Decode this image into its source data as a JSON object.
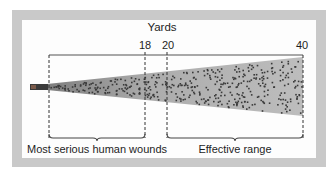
{
  "diagram": {
    "axis_title": "Yards",
    "ticks": [
      {
        "label": "18",
        "x": 145
      },
      {
        "label": "20",
        "x": 168
      },
      {
        "label": "40",
        "x": 302
      }
    ],
    "regions": [
      {
        "label": "Most serious human wounds",
        "from": 0,
        "to": 18
      },
      {
        "label": "Effective range",
        "from": 20,
        "to": 40
      }
    ],
    "colors": {
      "frame": "#c9c9c9",
      "panel": "#fdfdfd",
      "cone_fill": "#b9b9b9",
      "pellet": "#3a3a3a",
      "lines": "#444444",
      "barrel": "#333333"
    }
  }
}
